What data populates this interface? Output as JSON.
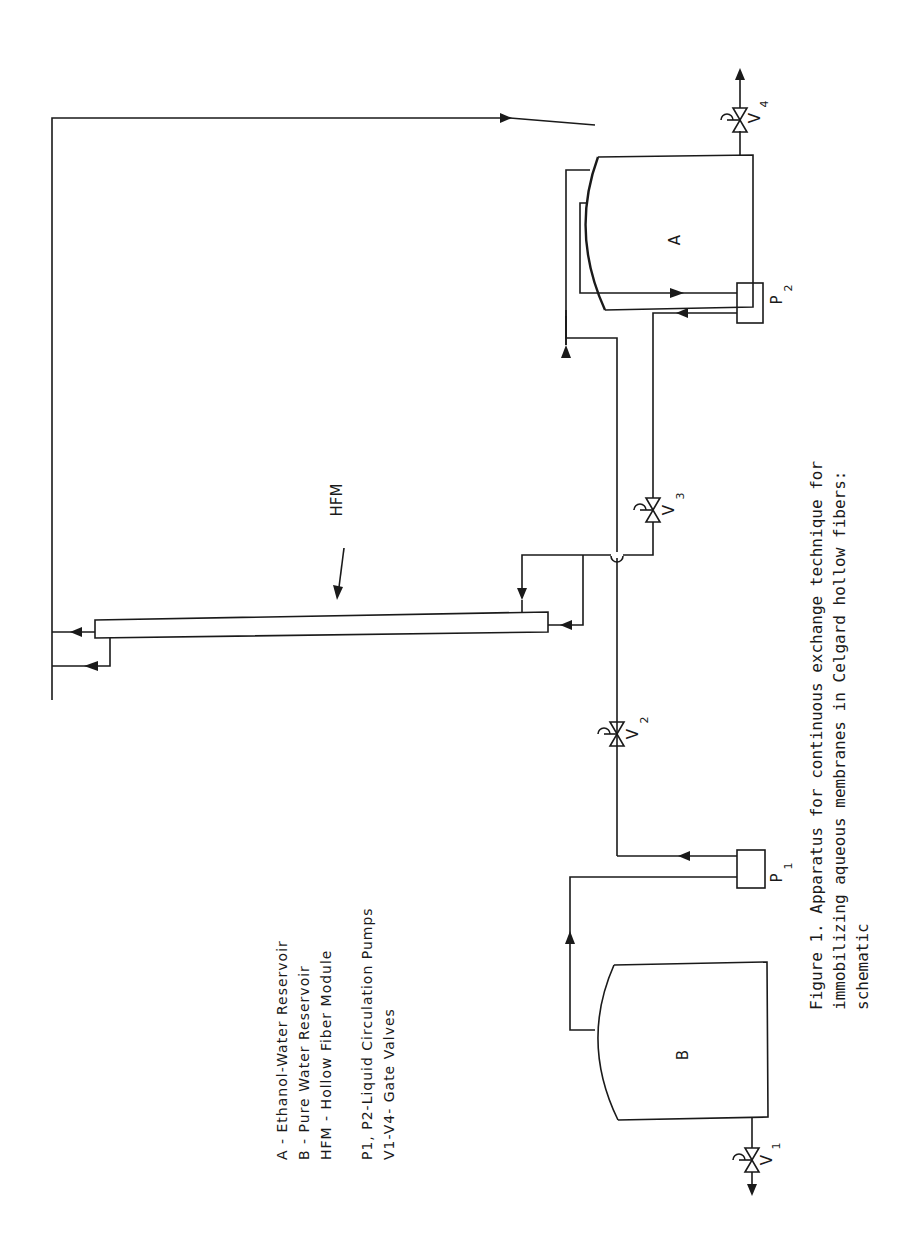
{
  "figure": {
    "orientation": "rotated-90-ccw",
    "caption_lines": [
      "Figure 1.  Apparatus for continuous exchange technique for",
      "immobilizing aqueous membranes in Celgard hollow fibers:",
      "schematic"
    ]
  },
  "components": {
    "tank_a": {
      "label": "A"
    },
    "tank_b": {
      "label": "B"
    },
    "hfm": {
      "label": "HFM"
    },
    "pump_1": {
      "label": "P",
      "sub": "1"
    },
    "pump_2": {
      "label": "P",
      "sub": "2"
    },
    "valve_1": {
      "label": "V",
      "sub": "1"
    },
    "valve_2": {
      "label": "V",
      "sub": "2"
    },
    "valve_3": {
      "label": "V",
      "sub": "3"
    },
    "valve_4": {
      "label": "V",
      "sub": "4"
    }
  },
  "legend": [
    {
      "key": "A",
      "text": "A - Ethanol-Water Reservoir"
    },
    {
      "key": "B",
      "text": "B - Pure Water Reservoir"
    },
    {
      "key": "HFM",
      "text": "HFM - Hollow Fiber Module"
    },
    {
      "key": "P",
      "text": "P1, P2-Liquid Circulation Pumps"
    },
    {
      "key": "V",
      "text": "V1-V4- Gate Valves"
    }
  ],
  "colors": {
    "ink": "#1a1a1a",
    "paper": "#ffffff"
  }
}
